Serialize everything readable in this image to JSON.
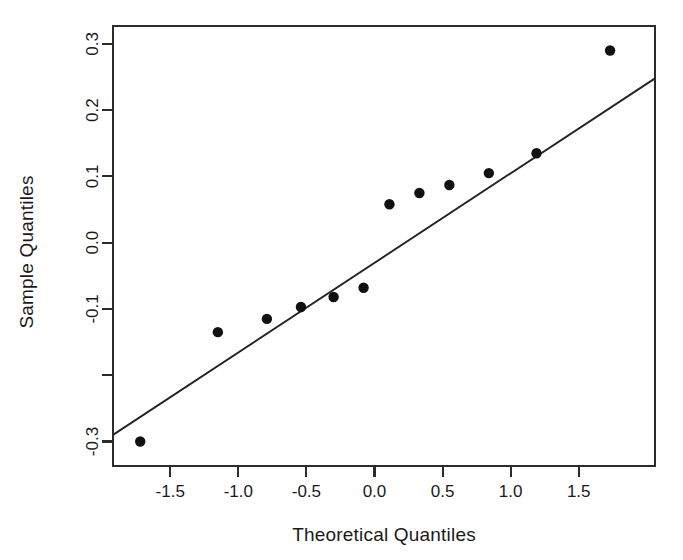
{
  "chart_data": {
    "type": "scatter",
    "title": "",
    "xlabel": "Theoretical Quantiles",
    "ylabel": "Sample Quantiles",
    "xlim": [
      -1.92,
      2.06
    ],
    "ylim": [
      -0.337,
      0.327
    ],
    "xticks": [
      -1.5,
      -1.0,
      -0.5,
      0.0,
      0.5,
      1.0,
      1.5
    ],
    "xtick_labels": [
      "-1.5",
      "-1.0",
      "-0.5",
      "0.0",
      "0.5",
      "1.0",
      "1.5"
    ],
    "yticks": [
      0.3,
      0.2,
      0.1,
      0.0,
      -0.1,
      -0.2,
      -0.3
    ],
    "ytick_labels": [
      "0.3",
      "0.2",
      "0.1",
      "0.0",
      "-0.1",
      "",
      "-0.3"
    ],
    "grid": false,
    "legend": null,
    "point_color": "#111111",
    "line_color": "#232323",
    "frame_color": "#2b2b2b",
    "background": "#ffffff",
    "marker": "filled-circle",
    "marker_size_px": 5.2,
    "x": [
      -1.72,
      -1.15,
      -0.79,
      -0.54,
      -0.3,
      -0.08,
      0.11,
      0.33,
      0.55,
      0.84,
      1.19,
      1.73
    ],
    "y": [
      -0.3,
      -0.135,
      -0.115,
      -0.097,
      -0.082,
      -0.068,
      0.058,
      0.075,
      0.087,
      0.105,
      0.135,
      0.29
    ],
    "points": [
      {
        "x": -1.72,
        "y": -0.3
      },
      {
        "x": -1.15,
        "y": -0.135
      },
      {
        "x": -0.79,
        "y": -0.115
      },
      {
        "x": -0.54,
        "y": -0.097
      },
      {
        "x": -0.3,
        "y": -0.082
      },
      {
        "x": -0.08,
        "y": -0.068
      },
      {
        "x": 0.11,
        "y": 0.058
      },
      {
        "x": 0.33,
        "y": 0.075
      },
      {
        "x": 0.55,
        "y": 0.087
      },
      {
        "x": 0.84,
        "y": 0.105
      },
      {
        "x": 1.19,
        "y": 0.135
      },
      {
        "x": 1.73,
        "y": 0.29
      }
    ],
    "reference_line": {
      "name": "qq-reference-line",
      "x_start": -1.92,
      "y_start": -0.29,
      "x_end": 2.06,
      "y_end": 0.248
    }
  }
}
